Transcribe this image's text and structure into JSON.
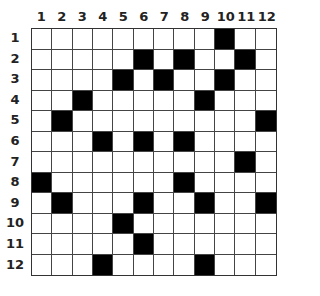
{
  "puzzle": {
    "rows": 12,
    "cols": 12,
    "column_labels": [
      "1",
      "2",
      "3",
      "4",
      "5",
      "6",
      "7",
      "8",
      "9",
      "10",
      "11",
      "12"
    ],
    "row_labels": [
      "1",
      "2",
      "3",
      "4",
      "5",
      "6",
      "7",
      "8",
      "9",
      "10",
      "11",
      "12"
    ],
    "black_cells": {
      "1": [
        10
      ],
      "2": [
        6,
        8,
        11
      ],
      "3": [
        5,
        7,
        10
      ],
      "4": [
        3,
        9
      ],
      "5": [
        2,
        12
      ],
      "6": [
        4,
        6,
        8
      ],
      "7": [
        11
      ],
      "8": [
        1,
        8
      ],
      "9": [
        2,
        6,
        9,
        12
      ],
      "10": [
        5
      ],
      "11": [
        6
      ],
      "12": [
        4,
        9
      ]
    },
    "colors": {
      "filled": "#000000",
      "empty": "#ffffff",
      "grid_line": "#444444"
    }
  }
}
